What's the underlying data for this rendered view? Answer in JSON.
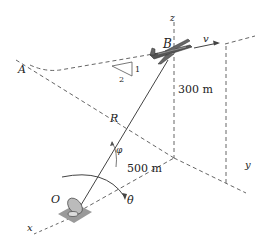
{
  "diagram": {
    "type": "3d-kinematics-figure",
    "points": {
      "A": "A",
      "B": "B",
      "O": "O"
    },
    "axes": {
      "x": "x",
      "y": "y",
      "z": "z"
    },
    "labels": {
      "velocity": "v",
      "range": "R",
      "elevation_angle": "φ",
      "azimuth_rate": "θ̇",
      "height": "300 m",
      "horizontal_distance": "500 m"
    },
    "slope_triangle": {
      "rise": "1",
      "run": "2"
    },
    "colors": {
      "line": "#555555",
      "ground_pad": "#9a9a9a",
      "text": "#222222"
    }
  }
}
